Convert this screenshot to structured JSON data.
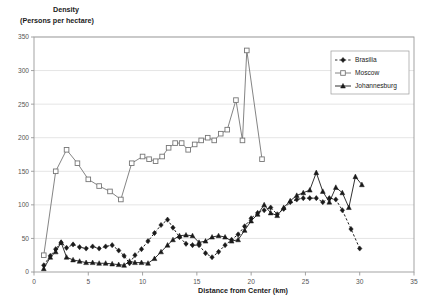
{
  "chart_data": {
    "type": "line",
    "title": "Density (Persons per hectare)",
    "title_line1": "Density",
    "title_line2": "(Persons per hectare)",
    "xlabel": "Distance from Center (km)",
    "ylabel": "Density (Persons per hectare)",
    "xlim": [
      0,
      35
    ],
    "ylim": [
      0,
      350
    ],
    "xticks": [
      0,
      5,
      10,
      15,
      20,
      25,
      30,
      35
    ],
    "yticks": [
      0,
      50,
      100,
      150,
      200,
      250,
      300,
      350
    ],
    "xtick_labels": [
      "0",
      "5",
      "10",
      "15",
      "20",
      "25",
      "30",
      "35"
    ],
    "ytick_labels": [
      "0",
      "50",
      "100",
      "150",
      "200",
      "250",
      "300",
      "350"
    ],
    "grid": "horizontal",
    "legend_position": "top-right",
    "series": [
      {
        "name": "Brasilia",
        "marker": "filled-diamond",
        "linestyle": "dashed",
        "color": "#1a1a1a",
        "points": [
          [
            0.9,
            10
          ],
          [
            1.5,
            24
          ],
          [
            2.0,
            34
          ],
          [
            2.5,
            44
          ],
          [
            3.0,
            36
          ],
          [
            3.6,
            41
          ],
          [
            4.2,
            37
          ],
          [
            4.8,
            35
          ],
          [
            5.4,
            38
          ],
          [
            6.0,
            35
          ],
          [
            6.6,
            38
          ],
          [
            7.2,
            40
          ],
          [
            7.8,
            32
          ],
          [
            8.3,
            24
          ],
          [
            8.8,
            13
          ],
          [
            9.3,
            25
          ],
          [
            9.9,
            34
          ],
          [
            10.5,
            46
          ],
          [
            11.1,
            58
          ],
          [
            11.7,
            70
          ],
          [
            12.3,
            78
          ],
          [
            12.8,
            66
          ],
          [
            13.4,
            52
          ],
          [
            14.0,
            42
          ],
          [
            14.6,
            40
          ],
          [
            15.2,
            40
          ],
          [
            15.8,
            28
          ],
          [
            16.4,
            22
          ],
          [
            17.0,
            30
          ],
          [
            17.6,
            40
          ],
          [
            18.2,
            48
          ],
          [
            18.8,
            56
          ],
          [
            19.4,
            68
          ],
          [
            20.0,
            80
          ],
          [
            20.6,
            88
          ],
          [
            21.2,
            92
          ],
          [
            21.8,
            96
          ],
          [
            22.4,
            86
          ],
          [
            23.0,
            94
          ],
          [
            23.6,
            104
          ],
          [
            24.2,
            108
          ],
          [
            24.8,
            110
          ],
          [
            25.4,
            110
          ],
          [
            26.0,
            110
          ],
          [
            26.6,
            104
          ],
          [
            27.2,
            110
          ],
          [
            27.8,
            108
          ],
          [
            28.4,
            92
          ],
          [
            29.2,
            64
          ],
          [
            30.0,
            35
          ]
        ]
      },
      {
        "name": "Moscow",
        "marker": "open-square",
        "linestyle": "solid",
        "color": "#767676",
        "points": [
          [
            0.9,
            25
          ],
          [
            2.0,
            150
          ],
          [
            3.0,
            182
          ],
          [
            4.0,
            162
          ],
          [
            5.0,
            138
          ],
          [
            6.0,
            128
          ],
          [
            7.0,
            120
          ],
          [
            8.0,
            108
          ],
          [
            9.0,
            162
          ],
          [
            10.0,
            172
          ],
          [
            10.6,
            168
          ],
          [
            11.2,
            165
          ],
          [
            11.8,
            172
          ],
          [
            12.4,
            185
          ],
          [
            13.0,
            192
          ],
          [
            13.6,
            192
          ],
          [
            14.2,
            182
          ],
          [
            14.8,
            190
          ],
          [
            15.4,
            196
          ],
          [
            16.0,
            200
          ],
          [
            16.6,
            196
          ],
          [
            17.2,
            206
          ],
          [
            17.8,
            212
          ],
          [
            18.6,
            256
          ],
          [
            19.2,
            196
          ],
          [
            19.6,
            330
          ],
          [
            21.0,
            168
          ]
        ]
      },
      {
        "name": "Johannesburg",
        "marker": "filled-triangle",
        "linestyle": "solid",
        "color": "#1a1a1a",
        "points": [
          [
            0.9,
            5
          ],
          [
            1.5,
            22
          ],
          [
            2.0,
            30
          ],
          [
            2.5,
            44
          ],
          [
            3.0,
            22
          ],
          [
            3.6,
            18
          ],
          [
            4.2,
            16
          ],
          [
            4.8,
            14
          ],
          [
            5.4,
            14
          ],
          [
            6.0,
            13
          ],
          [
            6.6,
            13
          ],
          [
            7.2,
            12
          ],
          [
            7.8,
            11
          ],
          [
            8.3,
            10
          ],
          [
            8.8,
            16
          ],
          [
            9.3,
            14
          ],
          [
            9.9,
            14
          ],
          [
            10.5,
            13
          ],
          [
            11.1,
            20
          ],
          [
            11.7,
            30
          ],
          [
            12.3,
            40
          ],
          [
            12.8,
            48
          ],
          [
            13.4,
            54
          ],
          [
            14.0,
            55
          ],
          [
            14.6,
            54
          ],
          [
            15.2,
            44
          ],
          [
            15.8,
            46
          ],
          [
            16.4,
            52
          ],
          [
            17.0,
            54
          ],
          [
            17.6,
            52
          ],
          [
            18.2,
            46
          ],
          [
            18.8,
            48
          ],
          [
            19.4,
            62
          ],
          [
            20.0,
            76
          ],
          [
            20.6,
            86
          ],
          [
            21.2,
            100
          ],
          [
            21.8,
            88
          ],
          [
            22.4,
            84
          ],
          [
            23.0,
            96
          ],
          [
            23.6,
            106
          ],
          [
            24.2,
            114
          ],
          [
            24.8,
            118
          ],
          [
            25.4,
            122
          ],
          [
            26.0,
            148
          ],
          [
            26.6,
            120
          ],
          [
            27.2,
            104
          ],
          [
            27.8,
            126
          ],
          [
            28.4,
            118
          ],
          [
            29.0,
            96
          ],
          [
            29.6,
            142
          ],
          [
            30.2,
            130
          ]
        ]
      }
    ]
  },
  "legend": {
    "items": [
      {
        "label": "Brasilia"
      },
      {
        "label": "Moscow"
      },
      {
        "label": "Johannesburg"
      }
    ]
  },
  "colors": {
    "brasilia": "#1a1a1a",
    "moscow": "#767676",
    "johannesburg": "#1a1a1a",
    "grid": "#d9d9d9",
    "axis": "#9a9a9a",
    "background": "#ffffff"
  }
}
